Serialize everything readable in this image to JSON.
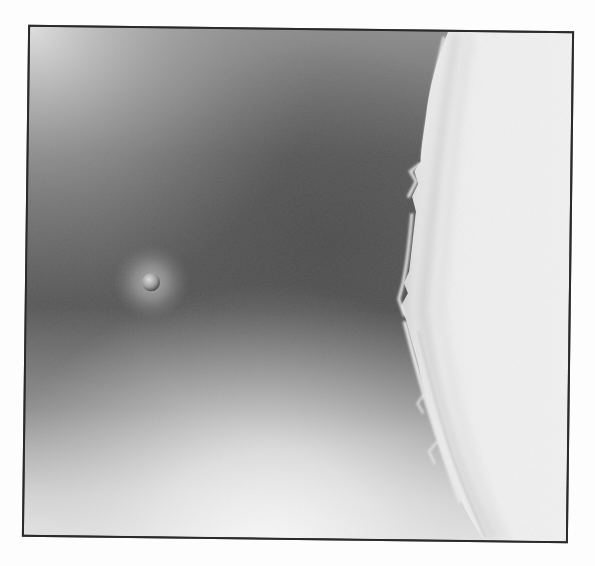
{
  "image": {
    "kind": "grayscale illustration",
    "description": "A small planet or moon with a soft halo floats in a dark gradient sky beside the bright limb of a large glowing body with ragged edge filaments.",
    "elements": {
      "small_body": {
        "label": "small moon with halo",
        "cx": 150,
        "cy": 282,
        "r": 9
      },
      "large_body": {
        "label": "bright limb of large body",
        "side": "right"
      },
      "frame": {
        "label": "dark border frame",
        "color": "#2a2a2a"
      }
    },
    "colors": {
      "sky_dark": "#4e4e4e",
      "sky_mid": "#7a7a7a",
      "sky_light": "#e8e8e8",
      "limb_bright": "#f2f2f2",
      "halo": "#9a9a9a",
      "page_bg": "#fdfdfd"
    }
  }
}
